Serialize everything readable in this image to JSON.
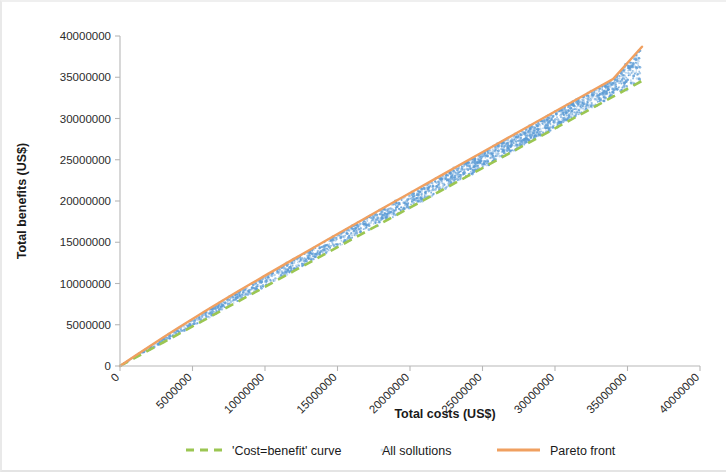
{
  "chart_data": {
    "type": "scatter",
    "title": "",
    "xlabel": "Total costs (US$)",
    "ylabel": "Total benefits (US$)",
    "xlim": [
      0,
      40000000
    ],
    "ylim": [
      0,
      40000000
    ],
    "grid": false,
    "legend_position": "bottom",
    "xticks": [
      0,
      5000000,
      10000000,
      15000000,
      20000000,
      25000000,
      30000000,
      35000000,
      40000000
    ],
    "xtick_labels": [
      "0",
      "5000000",
      "10000000",
      "15000000",
      "20000000",
      "25000000",
      "30000000",
      "35000000",
      "40000000"
    ],
    "yticks": [
      0,
      5000000,
      10000000,
      15000000,
      20000000,
      25000000,
      30000000,
      35000000,
      40000000
    ],
    "ytick_labels": [
      "0",
      "5000000",
      "10000000",
      "15000000",
      "20000000",
      "25000000",
      "30000000",
      "35000000",
      "40000000"
    ],
    "xtick_label_rotation": -45,
    "series": [
      {
        "name": "'Cost=benefit' curve",
        "type": "line",
        "style": "dashed",
        "color": "#9bc652",
        "x": [
          0,
          1000000,
          2000000,
          3000000,
          4000000,
          5000000,
          6000000,
          7000000,
          8000000,
          9000000,
          10000000,
          12000000,
          14000000,
          16000000,
          18000000,
          20000000,
          22000000,
          24000000,
          26000000,
          28000000,
          30000000,
          32000000,
          34000000,
          36000000
        ],
        "y": [
          0,
          960000,
          1920000,
          2880000,
          3840000,
          4800000,
          5760000,
          6720000,
          7680000,
          8640000,
          9600000,
          11520000,
          13440000,
          15360000,
          17280000,
          19200000,
          21120000,
          23040000,
          24960000,
          26880000,
          28800000,
          30720000,
          32640000,
          34560000
        ]
      },
      {
        "name": "All sollutions",
        "type": "scatter",
        "style": "dotted",
        "color": "#5b9bd5",
        "point_count": 2400,
        "note": "dense cloud of solutions lying between the 'Cost=benefit' curve and the Pareto front"
      },
      {
        "name": "Pareto front",
        "type": "line",
        "style": "solid",
        "color": "#f0a060",
        "x": [
          0,
          1000000,
          2000000,
          3000000,
          4000000,
          5000000,
          6000000,
          7000000,
          8000000,
          9000000,
          10000000,
          12000000,
          14000000,
          16000000,
          18000000,
          20000000,
          22000000,
          24000000,
          26000000,
          28000000,
          30000000,
          32000000,
          34000000,
          36000000
        ],
        "y": [
          0,
          1180000,
          2340000,
          3480000,
          4600000,
          5700000,
          6790000,
          7860000,
          8900000,
          9930000,
          10950000,
          12980000,
          15000000,
          17000000,
          18990000,
          20980000,
          22960000,
          24940000,
          26910000,
          28880000,
          30850000,
          32810000,
          34770000,
          38700000
        ]
      }
    ],
    "legend": [
      {
        "label": "'Cost=benefit' curve",
        "color": "#9bc652",
        "marker": "dashed-line"
      },
      {
        "label": "All sollutions",
        "color": "#9dc3e6",
        "marker": "dotted-point"
      },
      {
        "label": "Pareto front",
        "color": "#f0a060",
        "marker": "solid-line"
      }
    ]
  }
}
